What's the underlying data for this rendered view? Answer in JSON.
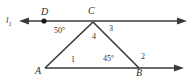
{
  "figure": {
    "type": "geometry-diagram",
    "background_color": "#ffffff",
    "stroke_color": "#3a3a3a",
    "labels": {
      "line_name": "l",
      "line_subscript": "1",
      "point_D": "D",
      "point_C": "C",
      "point_A": "A",
      "point_B": "B",
      "angle_50": "50°",
      "angle_4": "4",
      "angle_3": "3",
      "angle_1": "1",
      "angle_45": "45°",
      "angle_2": "2"
    },
    "geometry": {
      "line_l1": {
        "y": 21,
        "x_start": 22,
        "x_end": 185,
        "arrow_left": true,
        "arrow_right": true,
        "points_on_line": [
          "D",
          "C"
        ]
      },
      "ray_AB": {
        "y": 68,
        "x_start": 45,
        "x_end": 182,
        "arrow_left": false,
        "arrow_right": true,
        "points_on_line": [
          "A",
          "B"
        ]
      },
      "vertices": {
        "D": [
          44,
          21
        ],
        "C": [
          93,
          21
        ],
        "A": [
          45,
          68
        ],
        "B": [
          139,
          68
        ]
      },
      "segments": [
        [
          "A",
          "C"
        ],
        [
          "C",
          "B"
        ]
      ],
      "dot_points": [
        "D"
      ]
    }
  }
}
